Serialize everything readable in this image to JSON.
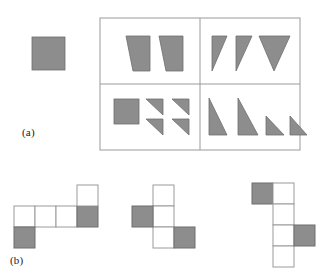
{
  "figure": {
    "panels": [
      {
        "id": "a",
        "label": "(a)"
      },
      {
        "id": "b",
        "label": "(b)"
      }
    ],
    "colors": {
      "shape_fill": "#8d8d8d",
      "shape_stroke": "#6e6e6e",
      "frame_stroke": "#9a9a9a",
      "cell_white": "#ffffff",
      "background": "#ffffff"
    }
  },
  "panel_a": {
    "label": "(a)",
    "prototype": {
      "name": "prototype-square",
      "kind": "square",
      "x": 32,
      "y": 37,
      "w": 33,
      "h": 33,
      "filled": true
    },
    "frame": {
      "x": 100,
      "y": 18,
      "w": 200,
      "h": 132,
      "rows": 2,
      "cols": 2
    },
    "quadrants": [
      {
        "id": "top-left",
        "name": "quadrant-top-left",
        "shape_count": 2,
        "shape_kind": "trapezoid",
        "shapes": [
          {
            "name": "trapezoid-1",
            "points": "126,36 150,36 150,71 133,71"
          },
          {
            "name": "trapezoid-2",
            "points": "159,36 183,36 183,71 166,71"
          }
        ]
      },
      {
        "id": "top-right",
        "name": "quadrant-top-right",
        "shape_count": 3,
        "shape_kind": "triangle-down",
        "shapes": [
          {
            "name": "triangle-down-1",
            "points": "212,36 227,36 212,71"
          },
          {
            "name": "triangle-down-2",
            "points": "236,36 252,36 236,71"
          },
          {
            "name": "triangle-down-3",
            "points": "259,36 290,36 274,71"
          }
        ]
      },
      {
        "id": "bottom-left",
        "name": "quadrant-bottom-left",
        "shape_count": 5,
        "shape_kind": "square-plus-4-triangles",
        "shapes": [
          {
            "name": "square-1",
            "kind": "square",
            "x": 114,
            "y": 99,
            "w": 25,
            "h": 25
          },
          {
            "name": "triangle-1",
            "points": "146,99 163,99 163,115"
          },
          {
            "name": "triangle-2",
            "points": "172,99 189,99 189,115"
          },
          {
            "name": "triangle-3",
            "points": "146,119 163,119 163,135"
          },
          {
            "name": "triangle-4",
            "points": "172,119 189,119 189,135"
          }
        ]
      },
      {
        "id": "bottom-right",
        "name": "quadrant-bottom-right",
        "shape_count": 4,
        "shape_kind": "triangle-right-descending",
        "shapes": [
          {
            "name": "triangle-1",
            "points": "209,98 209,135 227,135"
          },
          {
            "name": "triangle-2",
            "points": "238,98 238,135 258,135"
          },
          {
            "name": "triangle-3",
            "points": "266,116 266,135 284,135"
          },
          {
            "name": "triangle-4",
            "points": "290,116 290,135 307,135"
          }
        ]
      }
    ]
  },
  "panel_b": {
    "label": "(b)",
    "cell_size": 21,
    "nets": [
      {
        "id": "net-1",
        "name": "net-1",
        "origin": {
          "x": 14,
          "y": 185
        },
        "cells": [
          {
            "col": 0,
            "row": 1,
            "filled": false
          },
          {
            "col": 1,
            "row": 1,
            "filled": false
          },
          {
            "col": 2,
            "row": 1,
            "filled": false
          },
          {
            "col": 3,
            "row": 1,
            "filled": true
          },
          {
            "col": 3,
            "row": 0,
            "filled": false
          },
          {
            "col": 0,
            "row": 2,
            "filled": true
          }
        ]
      },
      {
        "id": "net-2",
        "name": "net-2",
        "origin": {
          "x": 132,
          "y": 185
        },
        "cells": [
          {
            "col": 1,
            "row": 0,
            "filled": false
          },
          {
            "col": 1,
            "row": 1,
            "filled": false
          },
          {
            "col": 1,
            "row": 2,
            "filled": false
          },
          {
            "col": 0,
            "row": 1,
            "filled": true
          },
          {
            "col": 2,
            "row": 2,
            "filled": true
          }
        ]
      },
      {
        "id": "net-3",
        "name": "net-3",
        "origin": {
          "x": 252,
          "y": 183
        },
        "cells": [
          {
            "col": 0,
            "row": 0,
            "filled": true
          },
          {
            "col": 1,
            "row": 0,
            "filled": false
          },
          {
            "col": 1,
            "row": 1,
            "filled": false
          },
          {
            "col": 1,
            "row": 2,
            "filled": false
          },
          {
            "col": 1,
            "row": 3,
            "filled": false
          },
          {
            "col": 2,
            "row": 2,
            "filled": true
          }
        ]
      }
    ]
  }
}
